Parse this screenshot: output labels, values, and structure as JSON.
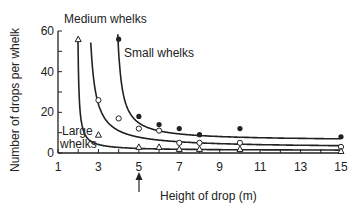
{
  "chart_data": {
    "type": "line",
    "title": "",
    "xlabel": "Height of drop (m)",
    "ylabel": "Number of drops per whelk",
    "xlim": [
      1,
      15
    ],
    "ylim": [
      0,
      60
    ],
    "x_ticks": [
      1,
      3,
      5,
      7,
      9,
      11,
      13,
      15
    ],
    "y_ticks": [
      0,
      20,
      40,
      60
    ],
    "grid": false,
    "legend": "inline labels",
    "annotation": {
      "type": "arrow",
      "x": 5,
      "direction": "up",
      "note": "marks 5 m on x-axis"
    },
    "series": [
      {
        "name": "Small whelks",
        "marker": "filled-circle",
        "points": [
          [
            4,
            56
          ],
          [
            5,
            18
          ],
          [
            6,
            14
          ],
          [
            7,
            12
          ],
          [
            8,
            9
          ],
          [
            10,
            12
          ],
          [
            15,
            8
          ]
        ]
      },
      {
        "name": "Medium whelks",
        "marker": "open-circle",
        "points": [
          [
            3,
            26
          ],
          [
            4,
            17
          ],
          [
            5,
            12
          ],
          [
            6,
            11
          ],
          [
            7,
            5
          ],
          [
            8,
            5
          ],
          [
            10,
            5
          ],
          [
            15,
            3
          ]
        ]
      },
      {
        "name": "Large whelks",
        "marker": "open-triangle",
        "points": [
          [
            2,
            56
          ],
          [
            3,
            9
          ],
          [
            5,
            3
          ],
          [
            6,
            3
          ],
          [
            7,
            2
          ],
          [
            8,
            2
          ],
          [
            10,
            2
          ],
          [
            15,
            1
          ]
        ]
      }
    ]
  },
  "labels": {
    "small": "Small whelks",
    "medium": "Medium whelks",
    "large_line1": "Large",
    "large_line2": "whelks",
    "xlabel": "Height of drop (m)",
    "ylabel": "Number of drops per whelk"
  },
  "colors": {
    "ink": "#222222",
    "background": "#ffffff"
  }
}
